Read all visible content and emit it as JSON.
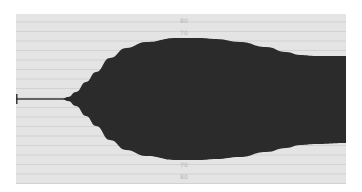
{
  "waveform_view": {
    "colors": {
      "background": "#e4e4e4",
      "gridline": "#cdcdcd",
      "waveform": "#2b2b2b",
      "label": "#b4b4b4"
    },
    "level_labels": {
      "top_outer": "80",
      "top_inner": "70",
      "bottom_inner": "70",
      "bottom_outer": "80"
    },
    "waveform": {
      "center_y": 85,
      "top_edge": [
        [
          0,
          85
        ],
        [
          46,
          85
        ],
        [
          52,
          83
        ],
        [
          60,
          78
        ],
        [
          70,
          68
        ],
        [
          80,
          58
        ],
        [
          94,
          44
        ],
        [
          110,
          34
        ],
        [
          130,
          28
        ],
        [
          160,
          24
        ],
        [
          184,
          24
        ],
        [
          200,
          25
        ],
        [
          224,
          28
        ],
        [
          250,
          33
        ],
        [
          270,
          38
        ],
        [
          284,
          41
        ],
        [
          300,
          42
        ],
        [
          330,
          42
        ]
      ],
      "bottom_edge": [
        [
          0,
          85
        ],
        [
          46,
          85
        ],
        [
          52,
          87
        ],
        [
          60,
          92
        ],
        [
          70,
          102
        ],
        [
          80,
          112
        ],
        [
          94,
          126
        ],
        [
          110,
          136
        ],
        [
          130,
          142
        ],
        [
          160,
          146
        ],
        [
          184,
          146
        ],
        [
          200,
          145
        ],
        [
          224,
          143
        ],
        [
          250,
          138
        ],
        [
          270,
          134
        ],
        [
          284,
          131
        ],
        [
          300,
          130
        ],
        [
          330,
          129
        ]
      ]
    }
  }
}
